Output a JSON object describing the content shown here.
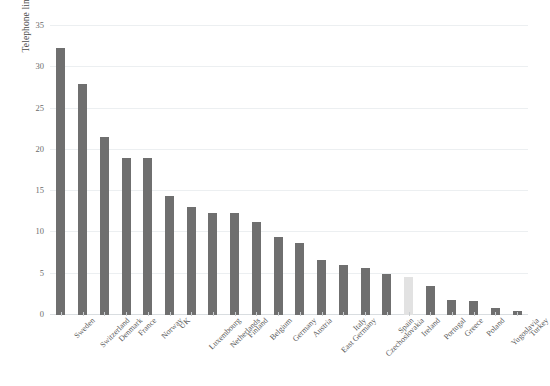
{
  "chart_data": {
    "type": "bar",
    "title": "",
    "subtitle": "",
    "xlabel": "",
    "ylabel": "Telephone lines per 100 inhabitants, 1958",
    "ylim": [
      0,
      35
    ],
    "yticks": [
      0,
      5,
      10,
      15,
      20,
      25,
      30,
      35
    ],
    "ytick_labels": [
      "0",
      "5",
      "10",
      "15",
      "20",
      "25",
      "30",
      "35"
    ],
    "grid": true,
    "legend": false,
    "legend_position": "none",
    "bar_color": "#6f6f6f",
    "highlight_color": "#e2e2e2",
    "highlight_category": "Ireland",
    "categories": [
      "Sweden",
      "Switzerland",
      "Denmark",
      "France",
      "Norway",
      "UK",
      "Luxembourg",
      "Netherlands",
      "Finland",
      "Belgium",
      "Germany",
      "Austria",
      "East Germany",
      "Italy",
      "Czechoslovakia",
      "Spain",
      "Ireland",
      "Portugal",
      "Greece",
      "Poland",
      "Yugoslavia",
      "Turkey"
    ],
    "values": [
      32.3,
      28.0,
      21.5,
      19.0,
      19.0,
      14.4,
      13.1,
      12.3,
      12.3,
      11.3,
      9.4,
      8.7,
      6.7,
      6.1,
      5.7,
      5.0,
      4.6,
      3.5,
      1.8,
      1.7,
      0.9,
      0.5
    ]
  }
}
